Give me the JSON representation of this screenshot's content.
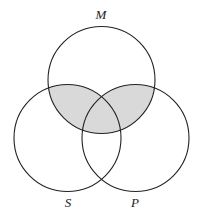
{
  "diagram": {
    "type": "venn-3",
    "circles": [
      {
        "id": "M",
        "label": "M",
        "cx": 101.5,
        "cy": 80,
        "r": 53.5
      },
      {
        "id": "S",
        "label": "S",
        "cx": 67.5,
        "cy": 138,
        "r": 53.5
      },
      {
        "id": "P",
        "label": "P",
        "cx": 135.5,
        "cy": 138,
        "r": 53.5
      }
    ],
    "shaded_region": "M ∩ (S ∪ P)",
    "shade_color": "#d9d9d9",
    "stroke_color": "#222222"
  }
}
